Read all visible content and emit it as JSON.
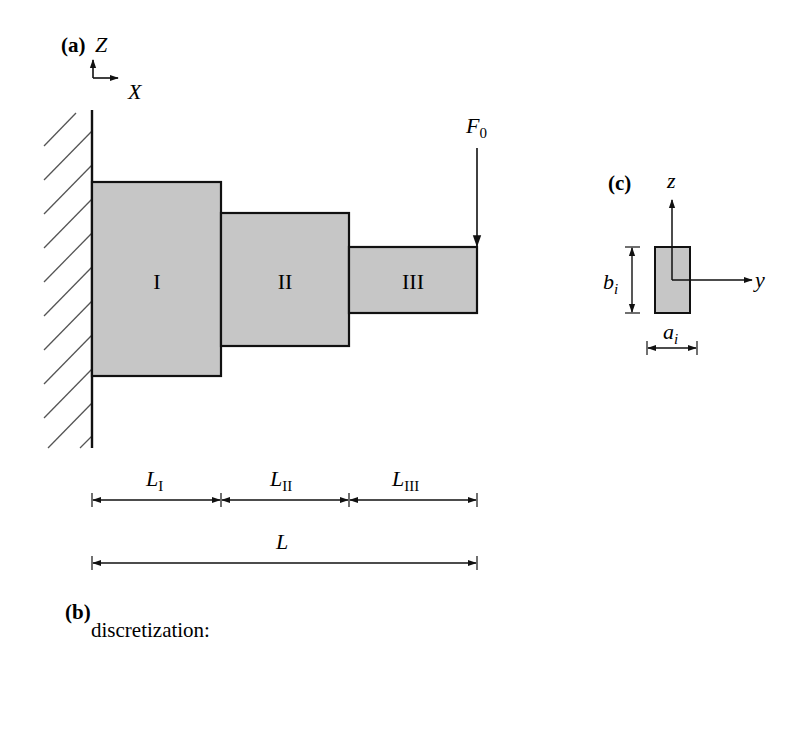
{
  "panel_a": {
    "label": "(a)",
    "axis_vertical": "Z",
    "axis_horizontal": "X",
    "segments": [
      {
        "name": "I",
        "label": "I",
        "x0": 92,
        "x1": 221,
        "y0": 182,
        "y1": 376
      },
      {
        "name": "II",
        "label": "II",
        "x0": 221,
        "x1": 349,
        "y0": 213,
        "y1": 346
      },
      {
        "name": "III",
        "label": "III",
        "x0": 349,
        "x1": 477,
        "y0": 247,
        "y1": 313
      }
    ],
    "force": {
      "label_main": "F",
      "label_sub": "0"
    },
    "dimensions": {
      "segment_lengths": [
        {
          "main": "L",
          "sub": "I"
        },
        {
          "main": "L",
          "sub": "II"
        },
        {
          "main": "L",
          "sub": "III"
        }
      ],
      "total_length": {
        "main": "L"
      }
    },
    "colors": {
      "fill": "#c6c6c6",
      "stroke": "#111111",
      "hatch": "#555555"
    }
  },
  "panel_b": {
    "label": "(b)",
    "text": "discretization:"
  },
  "panel_c": {
    "label": "(c)",
    "axis_vertical": "z",
    "axis_horizontal": "y",
    "height_dim": {
      "main": "b",
      "sub": "i"
    },
    "width_dim": {
      "main": "a",
      "sub": "i"
    }
  }
}
